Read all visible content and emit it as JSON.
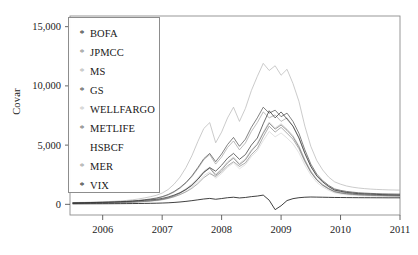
{
  "axis": {
    "ylabel": "Covar",
    "yticks": [
      "0",
      "5,000",
      "10,000",
      "15,000"
    ],
    "xticks": [
      "2006",
      "2007",
      "2008",
      "2009",
      "2010",
      "2011"
    ]
  },
  "legend": {
    "items": [
      {
        "label": "BOFA",
        "marker": "*",
        "color": "#2b2b2b"
      },
      {
        "label": "JPMCC",
        "marker": "*",
        "color": "#8a8a8a"
      },
      {
        "label": "MS",
        "marker": "*",
        "color": "#b5b5b5"
      },
      {
        "label": "GS",
        "marker": "*",
        "color": "#4a4a4a"
      },
      {
        "label": "WELLFARGO",
        "marker": "*",
        "color": "#c8c8c8"
      },
      {
        "label": "METLIFE",
        "marker": "*",
        "color": "#6f6f6f"
      },
      {
        "label": "HSBCF",
        "marker": " ",
        "color": "#d6d6d6"
      },
      {
        "label": "MER",
        "marker": "*",
        "color": "#9d9d9d"
      },
      {
        "label": "VIX",
        "marker": "*",
        "color": "#1e1e1e"
      }
    ]
  },
  "chart_data": {
    "type": "line",
    "title": "",
    "xlabel": "",
    "ylabel": "Covar",
    "xlim": [
      2005.45,
      2011.0
    ],
    "ylim": [
      -900,
      15900
    ],
    "yticks": [
      0,
      5000,
      10000,
      15000
    ],
    "xticks": [
      2006,
      2007,
      2008,
      2009,
      2010,
      2011
    ],
    "grid": false,
    "legend_position": "upper-left-inset",
    "x": [
      2005.5,
      2005.6,
      2005.7,
      2005.8,
      2005.9,
      2006.0,
      2006.1,
      2006.2,
      2006.3,
      2006.4,
      2006.5,
      2006.6,
      2006.7,
      2006.8,
      2006.9,
      2007.0,
      2007.1,
      2007.2,
      2007.3,
      2007.4,
      2007.5,
      2007.6,
      2007.7,
      2007.8,
      2007.9,
      2008.0,
      2008.1,
      2008.2,
      2008.3,
      2008.4,
      2008.5,
      2008.6,
      2008.7,
      2008.8,
      2008.9,
      2009.0,
      2009.1,
      2009.2,
      2009.3,
      2009.4,
      2009.5,
      2009.6,
      2009.7,
      2009.8,
      2009.9,
      2010.0,
      2010.1,
      2010.2,
      2010.3,
      2010.4,
      2010.5,
      2010.6,
      2010.7,
      2010.8,
      2010.9,
      2011.0
    ],
    "series": [
      {
        "name": "BOFA",
        "color": "#2b2b2b",
        "values": [
          120,
          130,
          140,
          150,
          160,
          170,
          180,
          200,
          220,
          240,
          260,
          300,
          340,
          380,
          420,
          500,
          620,
          780,
          980,
          1250,
          1600,
          2100,
          2700,
          3100,
          2800,
          3300,
          3900,
          4300,
          3800,
          4200,
          5000,
          5600,
          6800,
          7900,
          7300,
          7800,
          7200,
          6600,
          5600,
          4300,
          3200,
          2400,
          1900,
          1500,
          1200,
          1100,
          1000,
          950,
          900,
          880,
          860,
          840,
          820,
          800,
          790,
          780
        ]
      },
      {
        "name": "JPMCC",
        "color": "#8a8a8a",
        "values": [
          100,
          110,
          115,
          120,
          130,
          140,
          150,
          160,
          175,
          190,
          210,
          240,
          270,
          300,
          340,
          400,
          500,
          640,
          820,
          1050,
          1350,
          1750,
          2250,
          2600,
          2350,
          2750,
          3250,
          3600,
          3200,
          3500,
          4200,
          4700,
          5700,
          6600,
          6100,
          6500,
          6000,
          5500,
          4700,
          3600,
          2700,
          2050,
          1600,
          1300,
          1050,
          950,
          880,
          840,
          800,
          780,
          760,
          740,
          730,
          720,
          710,
          700
        ]
      },
      {
        "name": "MS",
        "color": "#b5b5b5",
        "values": [
          150,
          160,
          170,
          185,
          200,
          215,
          235,
          260,
          290,
          330,
          380,
          450,
          540,
          640,
          760,
          950,
          1250,
          1700,
          2300,
          3100,
          4100,
          5300,
          6400,
          6900,
          5200,
          6100,
          7300,
          8200,
          7000,
          8100,
          9600,
          10800,
          11900,
          11300,
          11700,
          10900,
          11400,
          10200,
          8700,
          6600,
          4900,
          3700,
          2900,
          2300,
          1900,
          1700,
          1550,
          1450,
          1380,
          1330,
          1290,
          1260,
          1240,
          1220,
          1210,
          1200
        ]
      },
      {
        "name": "GS",
        "color": "#4a4a4a",
        "values": [
          130,
          138,
          146,
          155,
          165,
          176,
          190,
          208,
          230,
          256,
          288,
          330,
          385,
          450,
          530,
          650,
          830,
          1080,
          1420,
          1850,
          2400,
          3100,
          3850,
          4300,
          3600,
          4250,
          5050,
          5650,
          4900,
          5500,
          6500,
          7300,
          8200,
          7700,
          7950,
          7400,
          7700,
          7000,
          6000,
          4600,
          3400,
          2550,
          2000,
          1600,
          1300,
          1180,
          1090,
          1030,
          980,
          950,
          925,
          905,
          890,
          880,
          872,
          865
        ]
      },
      {
        "name": "WELLFARGO",
        "color": "#c8c8c8",
        "values": [
          90,
          95,
          100,
          106,
          113,
          120,
          130,
          142,
          157,
          175,
          198,
          228,
          266,
          312,
          368,
          455,
          580,
          760,
          1000,
          1320,
          1720,
          2220,
          2800,
          3150,
          2550,
          3000,
          3600,
          4000,
          3450,
          3850,
          4600,
          5150,
          6100,
          6950,
          6450,
          6800,
          6350,
          5800,
          4950,
          3800,
          2850,
          2150,
          1700,
          1380,
          1130,
          1020,
          950,
          900,
          860,
          835,
          815,
          798,
          785,
          775,
          768,
          762
        ]
      },
      {
        "name": "METLIFE",
        "color": "#6f6f6f",
        "values": [
          80,
          85,
          90,
          96,
          102,
          109,
          118,
          129,
          143,
          160,
          181,
          209,
          244,
          287,
          339,
          420,
          540,
          710,
          940,
          1250,
          1640,
          2130,
          2700,
          3050,
          2450,
          2900,
          3500,
          3900,
          3350,
          3750,
          4500,
          5050,
          6000,
          6850,
          6350,
          6700,
          6250,
          5700,
          4850,
          3700,
          2750,
          2070,
          1630,
          1320,
          1080,
          975,
          905,
          858,
          820,
          795,
          776,
          760,
          748,
          738,
          731,
          725
        ]
      },
      {
        "name": "HSBCF",
        "color": "#d6d6d6",
        "values": [
          70,
          74,
          78,
          83,
          89,
          95,
          103,
          113,
          125,
          140,
          159,
          184,
          215,
          253,
          300,
          372,
          480,
          632,
          838,
          1110,
          1460,
          1900,
          2420,
          2740,
          2200,
          2600,
          3130,
          3500,
          3000,
          3360,
          4030,
          4530,
          5380,
          6150,
          5700,
          6020,
          5600,
          5110,
          4350,
          3320,
          2470,
          1860,
          1465,
          1185,
          970,
          875,
          813,
          770,
          736,
          713,
          696,
          682,
          671,
          662,
          656,
          651
        ]
      },
      {
        "name": "MER",
        "color": "#9d9d9d",
        "values": [
          110,
          118,
          126,
          135,
          145,
          156,
          169,
          186,
          206,
          231,
          262,
          302,
          353,
          415,
          492,
          612,
          788,
          1030,
          1360,
          1790,
          2330,
          3010,
          3760,
          4200,
          3400,
          4000,
          4800,
          5350,
          4600,
          5180,
          6150,
          6900,
          7800,
          7300,
          7550,
          7000,
          7300,
          6600,
          5650,
          4320,
          3200,
          2400,
          1880,
          1510,
          1230,
          1110,
          1025,
          968,
          922,
          893,
          870,
          852,
          838,
          828,
          820,
          814
        ]
      },
      {
        "name": "VIX",
        "color": "#1e1e1e",
        "values": [
          40,
          42,
          44,
          46,
          48,
          50,
          52,
          55,
          58,
          62,
          66,
          72,
          78,
          86,
          95,
          110,
          130,
          160,
          200,
          250,
          310,
          380,
          450,
          500,
          430,
          490,
          560,
          600,
          540,
          580,
          650,
          700,
          780,
          350,
          -450,
          -120,
          320,
          480,
          560,
          600,
          620,
          610,
          600,
          590,
          580,
          575,
          570,
          566,
          562,
          560,
          558,
          556,
          554,
          552,
          551,
          550
        ]
      }
    ]
  }
}
